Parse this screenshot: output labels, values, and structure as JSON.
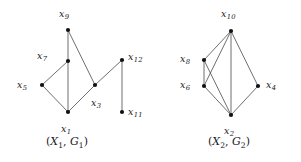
{
  "figure": {
    "width": 301,
    "height": 162,
    "background": "#ffffff",
    "edge_color": "#4a4a4a",
    "vertex_color": "#111111",
    "text_color": "#1a1a1a"
  },
  "graphs": [
    {
      "id": "G1",
      "caption_open": "(",
      "caption_x": "X",
      "caption_x_sub": "1",
      "caption_comma": ", ",
      "caption_g": "G",
      "caption_g_sub": "1",
      "caption_close": ")",
      "caption_text": "(X1, G1)",
      "caption_pos": {
        "x": 46,
        "y": 136
      },
      "vertices": [
        {
          "id": "x9",
          "label": "x",
          "sub": "9",
          "x": 68,
          "y": 30,
          "label_x": 59,
          "label_y": 9
        },
        {
          "id": "x7",
          "label": "x",
          "sub": "7",
          "x": 68,
          "y": 61,
          "label_x": 37,
          "label_y": 51
        },
        {
          "id": "x5",
          "label": "x",
          "sub": "5",
          "x": 42,
          "y": 85,
          "label_x": 17,
          "label_y": 80
        },
        {
          "id": "x3",
          "label": "x",
          "sub": "3",
          "x": 95,
          "y": 85,
          "label_x": 91,
          "label_y": 98
        },
        {
          "id": "x1",
          "label": "x",
          "sub": "1",
          "x": 68,
          "y": 112,
          "label_x": 61,
          "label_y": 124
        },
        {
          "id": "x12",
          "label": "x",
          "sub": "12",
          "x": 122,
          "y": 60,
          "label_x": 128,
          "label_y": 52
        },
        {
          "id": "x11",
          "label": "x",
          "sub": "11",
          "x": 122,
          "y": 112,
          "label_x": 128,
          "label_y": 107
        }
      ],
      "edges": [
        {
          "from": "x9",
          "to": "x7"
        },
        {
          "from": "x9",
          "to": "x3"
        },
        {
          "from": "x7",
          "to": "x5"
        },
        {
          "from": "x7",
          "to": "x1"
        },
        {
          "from": "x5",
          "to": "x1"
        },
        {
          "from": "x3",
          "to": "x1"
        },
        {
          "from": "x3",
          "to": "x12"
        },
        {
          "from": "x12",
          "to": "x11"
        }
      ]
    },
    {
      "id": "G2",
      "caption_open": "(",
      "caption_x": "X",
      "caption_x_sub": "2",
      "caption_comma": ", ",
      "caption_g": "G",
      "caption_g_sub": "2",
      "caption_close": ")",
      "caption_text": "(X2, G2)",
      "caption_pos": {
        "x": 208,
        "y": 136
      },
      "vertices": [
        {
          "id": "x10",
          "label": "x",
          "sub": "10",
          "x": 231,
          "y": 31,
          "label_x": 221,
          "label_y": 9
        },
        {
          "id": "x8",
          "label": "x",
          "sub": "8",
          "x": 204,
          "y": 60,
          "label_x": 180,
          "label_y": 54
        },
        {
          "id": "x6",
          "label": "x",
          "sub": "6",
          "x": 204,
          "y": 86,
          "label_x": 180,
          "label_y": 80
        },
        {
          "id": "x4",
          "label": "x",
          "sub": "4",
          "x": 258,
          "y": 86,
          "label_x": 266,
          "label_y": 80
        },
        {
          "id": "x2",
          "label": "x",
          "sub": "2",
          "x": 231,
          "y": 115,
          "label_x": 224,
          "label_y": 126
        }
      ],
      "edges": [
        {
          "from": "x10",
          "to": "x8"
        },
        {
          "from": "x10",
          "to": "x6"
        },
        {
          "from": "x10",
          "to": "x2"
        },
        {
          "from": "x10",
          "to": "x4"
        },
        {
          "from": "x8",
          "to": "x6"
        },
        {
          "from": "x8",
          "to": "x2"
        },
        {
          "from": "x6",
          "to": "x2"
        },
        {
          "from": "x4",
          "to": "x2"
        }
      ]
    }
  ]
}
